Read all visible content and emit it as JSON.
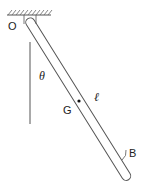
{
  "diagram": {
    "labels": {
      "pivot": "O",
      "angle": "θ",
      "center_of_mass": "G",
      "length": "ℓ",
      "end": "B"
    },
    "colors": {
      "stroke": "#555555",
      "text": "#222222",
      "background": "#ffffff"
    }
  }
}
